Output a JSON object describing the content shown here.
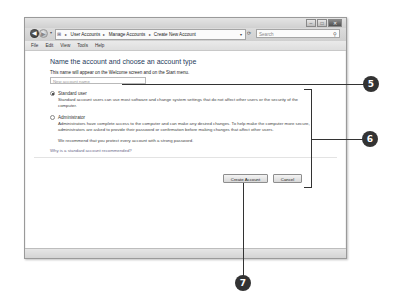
{
  "window": {
    "controls": {
      "minimize": "–",
      "maximize": "□",
      "close": "✕"
    },
    "nav": {
      "back_icon": "◀",
      "forward_icon": "▶",
      "dropdown_icon": "▾"
    },
    "address": {
      "icon": "⊞",
      "breadcrumb": [
        "User Accounts",
        "Manage Accounts",
        "Create New Account"
      ],
      "separator": "▸",
      "dropdown_icon": "▾"
    },
    "refresh_icon": "⟳",
    "search": {
      "placeholder": "Search",
      "icon": "⚲"
    },
    "menu": [
      "File",
      "Edit",
      "View",
      "Tools",
      "Help"
    ]
  },
  "page": {
    "heading": "Name the account and choose an account type",
    "subtext": "This name will appear on the Welcome screen and on the Start menu.",
    "name_input_placeholder": "New account name",
    "options": [
      {
        "label": "Standard user",
        "checked": true,
        "description": "Standard account users can use most software and change system settings that do not affect other users or the security of the computer."
      },
      {
        "label": "Administrator",
        "checked": false,
        "description": "Administrators have complete access to the computer and can make any desired changes. To help make the computer more secure, administrators are asked to provide their password or confirmation before making changes that affect other users."
      }
    ],
    "recommendation": "We recommend that you protect every account with a strong password.",
    "help_link": "Why is a standard account recommended?",
    "buttons": {
      "create": "Create Account",
      "cancel": "Cancel"
    }
  },
  "callouts": [
    "5",
    "6",
    "7"
  ]
}
